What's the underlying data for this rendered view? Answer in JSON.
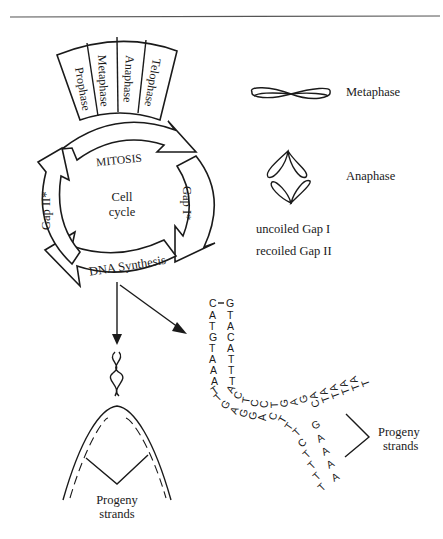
{
  "cell_cycle": {
    "center_label_line1": "Cell",
    "center_label_line2": "cycle",
    "mitosis_label": "MITOSIS",
    "mitosis_phases": [
      "Prophase",
      "Metaphase",
      "Anaphase",
      "Telophase"
    ],
    "gap1_label": "Gap I*",
    "gap2_label": "Gap II*",
    "dna_synthesis_label": "DNA Synthesis"
  },
  "legend": {
    "metaphase_label": "Metaphase",
    "anaphase_label": "Anaphase",
    "note_line1": "uncoiled Gap I",
    "note_line2": "recoiled Gap II"
  },
  "replication_fork_left": {
    "label_line1": "Progeny",
    "label_line2": "strands"
  },
  "replication_fork_right": {
    "label_line1": "Progeny",
    "label_line2": "strands",
    "paired_top_left": "C",
    "paired_top_right": "G",
    "left_strand": [
      "A",
      "T",
      "G",
      "T",
      "A",
      "A",
      "A",
      "T"
    ],
    "right_strand": [
      "T",
      "A",
      "C",
      "A",
      "T",
      "T",
      "T",
      "A"
    ],
    "upper_arc": [
      "A",
      "C",
      "T",
      "C",
      "C",
      "T",
      "G",
      "A",
      "G",
      "A",
      "A",
      "A",
      "A",
      "A"
    ],
    "lower_arc": [
      "T",
      "G",
      "A",
      "G",
      "G",
      "A",
      "C",
      "T",
      "T"
    ],
    "upper_progeny": [
      "C",
      "T",
      "T",
      "T",
      "T",
      "T"
    ],
    "lower_progeny_outer": [
      "G",
      "A",
      "A",
      "A",
      "A"
    ],
    "lower_progeny_inner": [
      "T",
      "C",
      "T",
      "T",
      "T",
      "T"
    ]
  },
  "colors": {
    "ink": "#1a1a1a",
    "background": "#ffffff",
    "rule": "#555555"
  }
}
